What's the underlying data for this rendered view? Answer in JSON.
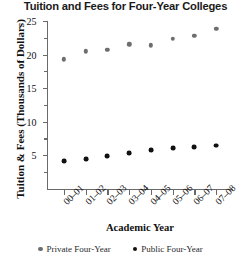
{
  "chart_data": {
    "type": "scatter",
    "title": "Tuition and Fees for Four-Year Colleges",
    "xlabel": "Academic Year",
    "ylabel": "Tuition & Fees (Thousands of Dollars)",
    "categories": [
      "00–01",
      "01–02",
      "02–03",
      "03–04",
      "04–05",
      "05–06",
      "06–07",
      "07–08"
    ],
    "ylim": [
      0,
      25
    ],
    "yticks": [
      5,
      10,
      15,
      20,
      25
    ],
    "ytick_labels": [
      "5",
      "10",
      "15",
      "20",
      "25"
    ],
    "yminor_ticks": [
      2.5,
      7.5,
      12.5,
      17.5,
      22.5
    ],
    "grid": false,
    "legend_position": "bottom",
    "series": [
      {
        "name": "Private Four-Year",
        "color": "#6e6e6e",
        "marker": "circle",
        "values": [
          19.3,
          20.5,
          20.7,
          21.5,
          21.4,
          22.3,
          22.8,
          23.8
        ]
      },
      {
        "name": "Public Four-Year",
        "color": "#111111",
        "marker": "circle",
        "values": [
          4.1,
          4.4,
          4.8,
          5.3,
          5.7,
          6.0,
          6.2,
          6.4
        ]
      }
    ]
  },
  "legend": {
    "private_label": "Private Four-Year",
    "public_label": "Public Four-Year"
  }
}
